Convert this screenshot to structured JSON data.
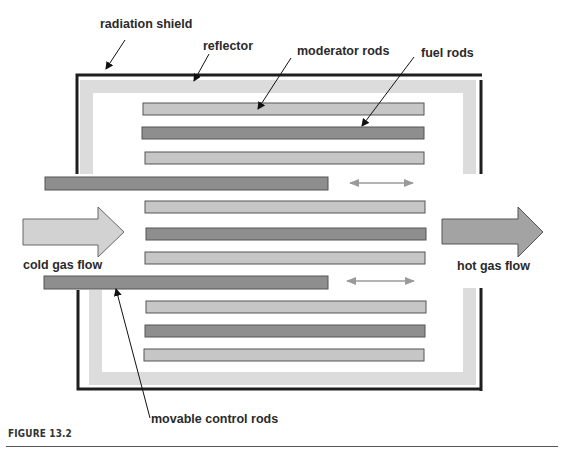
{
  "figure": {
    "caption": "FIGURE 13.2",
    "labels": {
      "radiation_shield": "radiation shield",
      "reflector": "reflector",
      "moderator_rods": "moderator rods",
      "fuel_rods": "fuel rods",
      "cold_gas_flow": "cold gas flow",
      "hot_gas_flow": "hot gas flow",
      "movable_control_rods": "movable control rods"
    },
    "colors": {
      "shield": "#1e1e1e",
      "reflector": "#dcdcdc",
      "moderator_rod": "#c6c6c6",
      "fuel_rod": "#8e8e8e",
      "control_rod": "#8e8e8e",
      "cold_arrow": "#d2d2d2",
      "hot_arrow": "#a3a3a3",
      "motion_arrow": "#9a9a9a"
    },
    "rods": [
      {
        "type": "moderator",
        "x": 143,
        "y": 103,
        "w": 281
      },
      {
        "type": "fuel",
        "x": 142,
        "y": 127,
        "w": 282
      },
      {
        "type": "moderator",
        "x": 145,
        "y": 152,
        "w": 279
      },
      {
        "type": "control",
        "x": 45,
        "y": 177,
        "w": 283
      },
      {
        "type": "moderator",
        "x": 145,
        "y": 201,
        "w": 280
      },
      {
        "type": "fuel",
        "x": 146,
        "y": 228,
        "w": 280
      },
      {
        "type": "moderator",
        "x": 145,
        "y": 252,
        "w": 280
      },
      {
        "type": "control",
        "x": 44,
        "y": 276,
        "w": 284
      },
      {
        "type": "moderator",
        "x": 146,
        "y": 301,
        "w": 280
      },
      {
        "type": "fuel",
        "x": 145,
        "y": 325,
        "w": 280
      },
      {
        "type": "moderator",
        "x": 144,
        "y": 349,
        "w": 280
      }
    ]
  }
}
